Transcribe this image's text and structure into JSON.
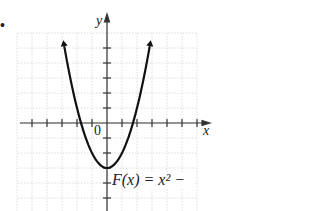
{
  "figure": {
    "bullet": "•",
    "function_label": "F(x) = x² −",
    "origin_label": "0",
    "x_axis_label": "x",
    "y_axis_label": "y",
    "colors": {
      "curve": "#111111",
      "axes": "#333333",
      "grid": "#c8c8c8"
    }
  },
  "chart_data": {
    "type": "line",
    "title": "",
    "function": "F(x) = x^2 - 3",
    "xlabel": "x",
    "ylabel": "y",
    "xlim": [
      -6,
      6
    ],
    "ylim": [
      -6,
      6
    ],
    "grid": true,
    "tick_spacing": 1,
    "x": [
      -2.9,
      -2.5,
      -2,
      -1.732,
      -1,
      0,
      1,
      1.732,
      2,
      2.5,
      2.9
    ],
    "series": [
      {
        "name": "F(x) = x² − 3",
        "values": [
          5.41,
          3.25,
          1,
          0,
          -2,
          -3,
          -2,
          0,
          1,
          3.25,
          5.41
        ]
      }
    ],
    "annotations": [
      "F(x) = x² −",
      "0"
    ],
    "arrows_on_curve_ends": true
  }
}
